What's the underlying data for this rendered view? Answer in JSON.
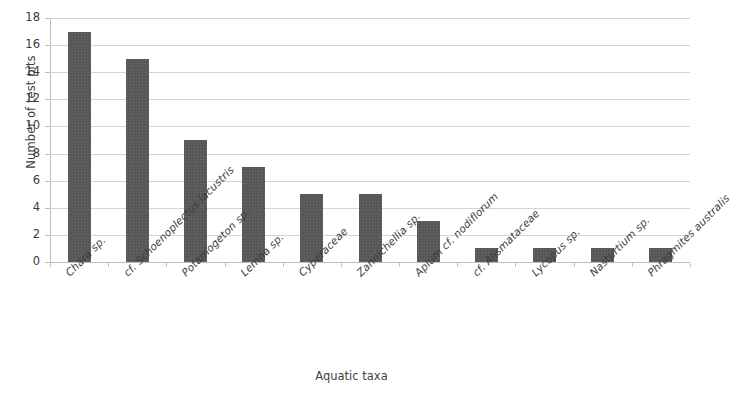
{
  "chart_data": {
    "type": "bar",
    "title": "",
    "xlabel": "Aquatic taxa",
    "ylabel": "Number of test pits",
    "categories": [
      "Chara sp.",
      "cf. Schoenoplectus lacustris",
      "Potamogeton sp.",
      "Lemna sp.",
      "Cyperaceae",
      "Zannichellia sp.",
      "Apium cf. nodiflorum",
      "cf. Alismataceae",
      "Lycopus sp.",
      "Nasturtium sp.",
      "Phragmites australis"
    ],
    "values": [
      17,
      15,
      9,
      7,
      5,
      5,
      3,
      1,
      1,
      1,
      1
    ],
    "ylim": [
      0,
      18
    ],
    "ytick_labels": [
      "0",
      "2",
      "4",
      "6",
      "8",
      "10",
      "12",
      "14",
      "16",
      "18"
    ],
    "ytick_values": [
      0,
      2,
      4,
      6,
      8,
      10,
      12,
      14,
      16,
      18
    ],
    "grid": true,
    "legend": "none",
    "bar_color": "#595959",
    "grid_color": "#d4d4d4",
    "axis_color": "#bdbdbd",
    "text_color": "#3b3b3b",
    "background": "#ffffff"
  }
}
